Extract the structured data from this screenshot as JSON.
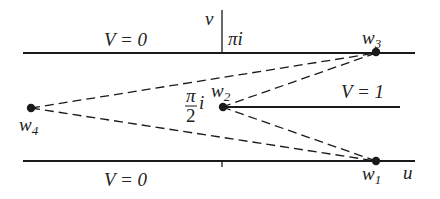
{
  "figure": {
    "type": "conformal-map-strip",
    "colors": {
      "ink": "#1a1a1a",
      "background": "#ffffff"
    }
  },
  "axes": {
    "horizontal_label": "u",
    "vertical_label": "v",
    "top_height_label": "πi",
    "mid_height_label_num": "π",
    "mid_height_label_den": "2",
    "mid_height_label_i": "i"
  },
  "regions": {
    "top_boundary": "V = 0",
    "bottom_boundary": "V = 0",
    "slit": "V = 1"
  },
  "points": [
    {
      "id": "w1",
      "base": "w",
      "sub": "1"
    },
    {
      "id": "w2",
      "base": "w",
      "sub": "2"
    },
    {
      "id": "w3",
      "base": "w",
      "sub": "3"
    },
    {
      "id": "w4",
      "base": "w",
      "sub": "4"
    }
  ]
}
